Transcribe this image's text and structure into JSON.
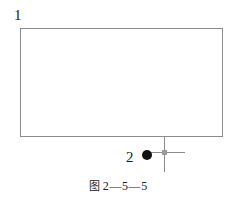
{
  "figure": {
    "caption_prefix": "图",
    "caption_number": "2—5—5",
    "caption_full": "图 2—5—5",
    "background_color": "#ffffff",
    "line_color": "#8c8c8c",
    "marker_color": "#111111",
    "width": 237,
    "height": 202
  },
  "callouts": [
    {
      "id": "callout-1",
      "label": "1",
      "refers_to": "rectangle-body",
      "x": 14,
      "y": 8
    },
    {
      "id": "callout-2",
      "label": "2",
      "refers_to": "support-point-marker",
      "x": 126,
      "y": 150
    }
  ],
  "shapes": {
    "rectangle": {
      "name": "rectangle-body",
      "x": 20,
      "y": 28,
      "width": 202,
      "height": 108,
      "stroke": "#8c8c8c",
      "stroke_width": 1,
      "fill": "none"
    },
    "stem_line": {
      "name": "vertical-stem-line",
      "x1": 164,
      "y1": 136,
      "x2": 164,
      "y2": 172,
      "stroke": "#8c8c8c",
      "stroke_width": 1
    },
    "cross_horizontal": {
      "name": "cross-horizontal-line",
      "x1": 150,
      "y1": 152,
      "x2": 185,
      "y2": 152,
      "stroke": "#8c8c8c",
      "stroke_width": 1
    },
    "cross_hub": {
      "name": "cross-center-hub",
      "cx": 164,
      "cy": 152,
      "size": 5,
      "fill": "#9a9a9a"
    },
    "dot": {
      "name": "support-point-marker",
      "cx": 147,
      "cy": 155,
      "r": 5,
      "fill": "#111111"
    }
  }
}
